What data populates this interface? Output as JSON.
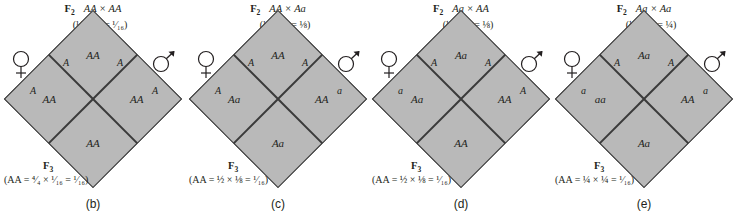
{
  "figure": {
    "caption_style": "punnett-square-series",
    "fill_color": "#b9b9b9",
    "line_color": "#3a3a3a",
    "text_color": "#231f20"
  },
  "panels": [
    {
      "label": "(b)",
      "generation_label": "F",
      "generation_sub": "2",
      "cross": "AA × AA",
      "probability": "(¼ × ¼ = ¹⁄₁₆)",
      "female_symbol": "female-symbol",
      "male_symbol": "male-symbol",
      "female_gametes": {
        "top": "A",
        "bottom": "A"
      },
      "male_gametes": {
        "top": "A",
        "bottom": "A"
      },
      "cells": {
        "top": "AA",
        "left": "AA",
        "right": "AA",
        "bottom": "AA"
      },
      "offspring_label": "F",
      "offspring_sub": "3",
      "result": "(AA = ⁴⁄₄ × ¹⁄₁₆ = ¹⁄₁₆)"
    },
    {
      "label": "(c)",
      "generation_label": "F",
      "generation_sub": "2",
      "cross": "AA × Aa",
      "probability": "(¼ × ½ = ⅛)",
      "female_symbol": "female-symbol",
      "male_symbol": "male-symbol",
      "female_gametes": {
        "top": "A",
        "bottom": "A"
      },
      "male_gametes": {
        "top": "A",
        "bottom": "a"
      },
      "cells": {
        "top": "AA",
        "left": "AA",
        "right": "Aa",
        "bottom": "Aa"
      },
      "offspring_label": "F",
      "offspring_sub": "3",
      "result": "(AA = ½ × ⅛ = ¹⁄₁₆)"
    },
    {
      "label": "(d)",
      "generation_label": "F",
      "generation_sub": "2",
      "cross": "Aa × AA",
      "probability": "(½ × ¼ = ⅛)",
      "female_symbol": "female-symbol",
      "male_symbol": "male-symbol",
      "female_gametes": {
        "top": "A",
        "bottom": "a"
      },
      "male_gametes": {
        "top": "A",
        "bottom": "A"
      },
      "cells": {
        "top": "AA",
        "left": "Aa",
        "right": "AA",
        "bottom": "Aa"
      },
      "offspring_label": "F",
      "offspring_sub": "3",
      "result": "(AA = ½ × ⅛ = ¹⁄₁₆)"
    },
    {
      "label": "(e)",
      "generation_label": "F",
      "generation_sub": "2",
      "cross": "Aa × Aa",
      "probability": "(½ × ½ = ¼)",
      "female_symbol": "female-symbol",
      "male_symbol": "male-symbol",
      "female_gametes": {
        "top": "A",
        "bottom": "a"
      },
      "male_gametes": {
        "top": "A",
        "bottom": "a"
      },
      "cells": {
        "top": "AA",
        "left": "Aa",
        "right": "Aa",
        "bottom": "aa"
      },
      "offspring_label": "F",
      "offspring_sub": "3",
      "result": "(AA = ¼ × ¼ = ¹⁄₁₆)"
    }
  ]
}
